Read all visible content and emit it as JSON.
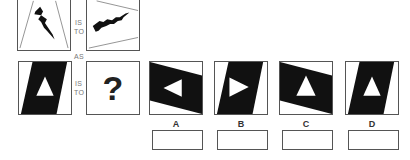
{
  "puzzle": {
    "connectors": {
      "is": "IS",
      "to": "TO",
      "as": "AS"
    },
    "question_mark": "?",
    "premise_pair": [
      {
        "id": "premise-1",
        "content": "lightning-bolt-vertical-in-trapezoid"
      },
      {
        "id": "premise-2",
        "content": "lightning-bolt-rotated-horizontal-in-trapezoid"
      }
    ],
    "query_figure": {
      "id": "query",
      "content": "black-parallelogram-with-white-up-triangle"
    },
    "options": [
      {
        "label": "A",
        "content": "rotated-parallelogram-with-white-left-triangle",
        "answer": ""
      },
      {
        "label": "B",
        "content": "parallelogram-with-white-right-triangle",
        "answer": ""
      },
      {
        "label": "C",
        "content": "rotated-parallelogram-with-white-up-triangle",
        "answer": ""
      },
      {
        "label": "D",
        "content": "parallelogram-with-white-up-triangle",
        "answer": ""
      }
    ],
    "colors": {
      "fill": "#111111",
      "border": "#555555",
      "text": "#777777"
    }
  }
}
